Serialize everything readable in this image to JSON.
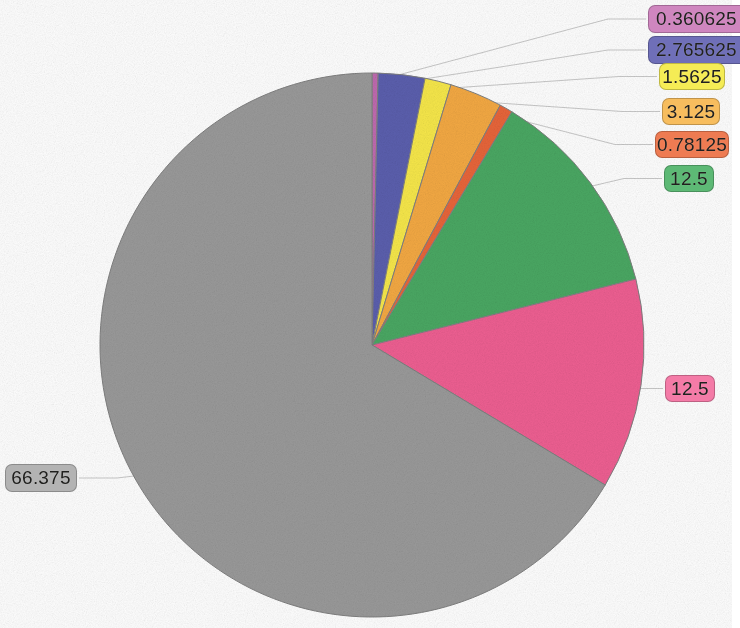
{
  "chart_data": {
    "type": "pie",
    "title": "",
    "legend_position": "none",
    "grid": false,
    "total": 100.0,
    "start_angle_deg": 0,
    "direction": "clockwise",
    "categories": [
      "0.360625",
      "2.765625",
      "1.5625",
      "3.125",
      "0.78125",
      "12.5",
      "12.5",
      "66.375"
    ],
    "values": [
      0.360625,
      2.765625,
      1.5625,
      3.125,
      0.78125,
      12.5,
      12.5,
      66.375
    ],
    "labels": [
      "0.360625",
      "2.765625",
      "1.5625",
      "3.125",
      "0.78125",
      "12.5",
      "12.5",
      "66.375"
    ],
    "colors": [
      "#c06ab0",
      "#5b5fae",
      "#f7e84a",
      "#f4a943",
      "#e8653a",
      "#4aa863",
      "#ef5f92",
      "#9a9a9a"
    ]
  },
  "chart": {
    "center_x": 372,
    "center_y": 345,
    "radius": 272,
    "slice_stroke": "#808080"
  },
  "slices": [
    {
      "name": "slice-magenta",
      "label": "0.360625",
      "value": 0.360625,
      "color": "#c06ab0",
      "badge_fill": "#cf86bf",
      "badge_text": "0.360625"
    },
    {
      "name": "slice-purple",
      "label": "2.765625",
      "value": 2.765625,
      "color": "#5b5fae",
      "badge_fill": "#6f6fb8",
      "badge_text": "2.765625"
    },
    {
      "name": "slice-yellow",
      "label": "1.5625",
      "value": 1.5625,
      "color": "#f7e84a",
      "badge_fill": "#f5ec55",
      "badge_text": "1.5625"
    },
    {
      "name": "slice-orange",
      "label": "3.125",
      "value": 3.125,
      "color": "#f4a943",
      "badge_fill": "#f7bd5e",
      "badge_text": "3.125"
    },
    {
      "name": "slice-dark-orange",
      "label": "0.78125",
      "value": 0.78125,
      "color": "#e8653a",
      "badge_fill": "#ee7b52",
      "badge_text": "0.78125"
    },
    {
      "name": "slice-green",
      "label": "12.5",
      "value": 12.5,
      "color": "#4aa863",
      "badge_fill": "#5db975",
      "badge_text": "12.5"
    },
    {
      "name": "slice-pink",
      "label": "12.5",
      "value": 12.5,
      "color": "#ef5f92",
      "badge_fill": "#f47ba7",
      "badge_text": "12.5"
    },
    {
      "name": "slice-gray",
      "label": "66.375",
      "value": 66.375,
      "color": "#9a9a9a",
      "badge_fill": "#b3b3b3",
      "badge_text": "66.375"
    }
  ],
  "badges": [
    {
      "id": "badge-0",
      "text": "0.360625",
      "fill": "#cf86bf",
      "left": 648,
      "top": 5,
      "width": 92,
      "height": 28,
      "clipped": true
    },
    {
      "id": "badge-1",
      "text": "2.765625",
      "fill": "#6f6fb8",
      "left": 648,
      "top": 36,
      "width": 92,
      "height": 28,
      "clipped": true
    },
    {
      "id": "badge-2",
      "text": "1.5625",
      "fill": "#f5ec55",
      "left": 659,
      "top": 63,
      "width": 66,
      "height": 27,
      "clipped": false
    },
    {
      "id": "badge-3",
      "text": "3.125",
      "fill": "#f7bd5e",
      "left": 662,
      "top": 98,
      "width": 58,
      "height": 27,
      "clipped": false
    },
    {
      "id": "badge-4",
      "text": "0.78125",
      "fill": "#ee7b52",
      "left": 655,
      "top": 131,
      "width": 74,
      "height": 27,
      "clipped": false
    },
    {
      "id": "badge-5",
      "text": "12.5",
      "fill": "#5db975",
      "left": 664,
      "top": 165,
      "width": 50,
      "height": 27,
      "clipped": false
    },
    {
      "id": "badge-6",
      "text": "12.5",
      "fill": "#f47ba7",
      "left": 665,
      "top": 375,
      "width": 50,
      "height": 27,
      "clipped": false
    },
    {
      "id": "badge-7",
      "text": "66.375",
      "fill": "#b3b3b3",
      "left": 5,
      "top": 464,
      "width": 72,
      "height": 28,
      "clipped": false
    }
  ]
}
